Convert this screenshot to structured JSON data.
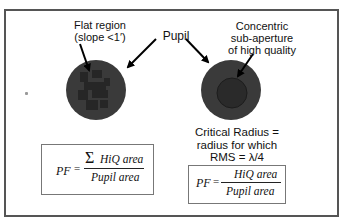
{
  "labels": {
    "flat_region_line1": "Flat region",
    "flat_region_line2": "(slope <1′)",
    "pupil": "Pupil",
    "concentric_line1": "Concentric",
    "concentric_line2": "sub-aperture",
    "concentric_line3": "of high quality",
    "critical_line1": "Critical Radius =",
    "critical_line2": "radius for which",
    "critical_line3": "RMS = λ/4"
  },
  "formula_left": {
    "lhs": "PF",
    "equals": "=",
    "sum_symbol": "Σ",
    "numerator": "HiQ area",
    "denominator": "Pupil area"
  },
  "formula_right": {
    "lhs": "PF",
    "equals": "=",
    "numerator": "HiQ area",
    "denominator": "Pupil area"
  },
  "colors": {
    "circle_fill": "#3a3a3a",
    "inner_circle": "#2a2a2a",
    "patch": "#262626",
    "frame": "#555555"
  }
}
